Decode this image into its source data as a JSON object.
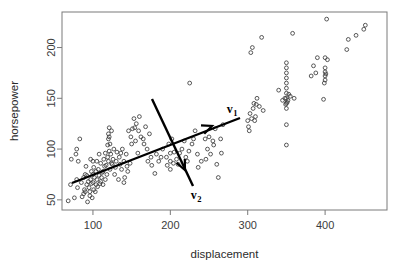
{
  "chart_data": {
    "type": "scatter",
    "title": "",
    "xlabel": "displacement",
    "ylabel": "horsepower",
    "xlim": [
      60,
      480
    ],
    "ylim": [
      40,
      235
    ],
    "xticks": [
      100,
      200,
      300,
      400
    ],
    "yticks": [
      50,
      100,
      150,
      200
    ],
    "grid": false,
    "legend": null,
    "marker": "open-circle",
    "marker_color": "#3b3b3b",
    "points": [
      [
        68,
        49
      ],
      [
        71,
        65
      ],
      [
        72,
        90
      ],
      [
        76,
        52
      ],
      [
        78,
        95
      ],
      [
        79,
        70
      ],
      [
        79,
        100
      ],
      [
        80,
        62
      ],
      [
        81,
        88
      ],
      [
        83,
        110
      ],
      [
        85,
        67
      ],
      [
        86,
        53
      ],
      [
        88,
        72
      ],
      [
        89,
        60
      ],
      [
        90,
        58
      ],
      [
        90,
        75
      ],
      [
        91,
        83
      ],
      [
        92,
        65
      ],
      [
        93,
        48
      ],
      [
        94,
        68
      ],
      [
        95,
        62
      ],
      [
        96,
        54
      ],
      [
        97,
        70
      ],
      [
        97,
        90
      ],
      [
        98,
        66
      ],
      [
        98,
        78
      ],
      [
        99,
        52
      ],
      [
        100,
        75
      ],
      [
        100,
        88
      ],
      [
        100,
        67
      ],
      [
        101,
        60
      ],
      [
        102,
        72
      ],
      [
        103,
        58
      ],
      [
        104,
        65
      ],
      [
        105,
        70
      ],
      [
        105,
        88
      ],
      [
        106,
        63
      ],
      [
        107,
        80
      ],
      [
        108,
        74
      ],
      [
        108,
        95
      ],
      [
        110,
        68
      ],
      [
        110,
        86
      ],
      [
        111,
        72
      ],
      [
        112,
        77
      ],
      [
        113,
        65
      ],
      [
        114,
        90
      ],
      [
        115,
        83
      ],
      [
        116,
        70
      ],
      [
        116,
        96
      ],
      [
        118,
        75
      ],
      [
        119,
        92
      ],
      [
        120,
        88
      ],
      [
        120,
        110
      ],
      [
        120,
        115
      ],
      [
        121,
        98
      ],
      [
        121,
        112
      ],
      [
        122,
        80
      ],
      [
        122,
        105
      ],
      [
        123,
        95
      ],
      [
        124,
        118
      ],
      [
        125,
        85
      ],
      [
        126,
        90
      ],
      [
        127,
        100
      ],
      [
        128,
        75
      ],
      [
        130,
        88
      ],
      [
        131,
        97
      ],
      [
        133,
        70
      ],
      [
        134,
        92
      ],
      [
        135,
        85
      ],
      [
        137,
        80
      ],
      [
        138,
        100
      ],
      [
        140,
        88
      ],
      [
        140,
        67
      ],
      [
        141,
        72
      ],
      [
        143,
        95
      ],
      [
        145,
        78
      ],
      [
        146,
        118
      ],
      [
        148,
        86
      ],
      [
        150,
        105
      ],
      [
        151,
        120
      ],
      [
        153,
        130
      ],
      [
        155,
        108
      ],
      [
        156,
        125
      ],
      [
        158,
        96
      ],
      [
        160,
        132
      ],
      [
        162,
        112
      ],
      [
        165,
        110
      ],
      [
        168,
        122
      ],
      [
        170,
        100
      ],
      [
        171,
        88
      ],
      [
        173,
        115
      ],
      [
        175,
        92
      ],
      [
        180,
        76
      ],
      [
        182,
        95
      ],
      [
        185,
        88
      ],
      [
        190,
        100
      ],
      [
        195,
        92
      ],
      [
        198,
        105
      ],
      [
        200,
        96
      ],
      [
        200,
        88
      ],
      [
        200,
        80
      ],
      [
        202,
        110
      ],
      [
        205,
        97
      ],
      [
        208,
        90
      ],
      [
        210,
        85
      ],
      [
        215,
        100
      ],
      [
        218,
        108
      ],
      [
        220,
        92
      ],
      [
        222,
        88
      ],
      [
        225,
        165
      ],
      [
        228,
        105
      ],
      [
        230,
        110
      ],
      [
        232,
        118
      ],
      [
        235,
        95
      ],
      [
        240,
        88
      ],
      [
        245,
        110
      ],
      [
        248,
        100
      ],
      [
        250,
        112
      ],
      [
        252,
        95
      ],
      [
        255,
        108
      ],
      [
        258,
        120
      ],
      [
        260,
        85
      ],
      [
        262,
        72
      ],
      [
        265,
        110
      ],
      [
        268,
        124
      ],
      [
        300,
        128
      ],
      [
        302,
        118
      ],
      [
        303,
        135
      ],
      [
        304,
        195
      ],
      [
        305,
        130
      ],
      [
        306,
        200
      ],
      [
        307,
        140
      ],
      [
        308,
        145
      ],
      [
        310,
        132
      ],
      [
        312,
        150
      ],
      [
        315,
        142
      ],
      [
        318,
        210
      ],
      [
        320,
        138
      ],
      [
        340,
        158
      ],
      [
        345,
        148
      ],
      [
        348,
        150
      ],
      [
        350,
        104
      ],
      [
        350,
        124
      ],
      [
        350,
        140
      ],
      [
        350,
        145
      ],
      [
        350,
        150
      ],
      [
        350,
        155
      ],
      [
        350,
        160
      ],
      [
        350,
        165
      ],
      [
        350,
        170
      ],
      [
        350,
        175
      ],
      [
        350,
        180
      ],
      [
        350,
        185
      ],
      [
        352,
        148
      ],
      [
        355,
        152
      ],
      [
        358,
        214
      ],
      [
        360,
        150
      ],
      [
        382,
        172
      ],
      [
        385,
        182
      ],
      [
        388,
        175
      ],
      [
        390,
        190
      ],
      [
        398,
        149
      ],
      [
        400,
        168
      ],
      [
        400,
        172
      ],
      [
        400,
        176
      ],
      [
        400,
        180
      ],
      [
        400,
        190
      ],
      [
        402,
        228
      ],
      [
        428,
        198
      ],
      [
        430,
        208
      ],
      [
        440,
        212
      ],
      [
        450,
        218
      ],
      [
        452,
        222
      ],
      [
        88,
        56
      ],
      [
        92,
        74
      ],
      [
        96,
        58
      ],
      [
        101,
        82
      ],
      [
        104,
        78
      ],
      [
        109,
        66
      ],
      [
        113,
        78
      ],
      [
        117,
        84
      ],
      [
        119,
        104
      ],
      [
        121,
        121
      ],
      [
        124,
        86
      ],
      [
        129,
        82
      ],
      [
        136,
        96
      ],
      [
        144,
        83
      ],
      [
        149,
        112
      ],
      [
        154,
        121
      ],
      [
        159,
        118
      ],
      [
        166,
        105
      ],
      [
        176,
        84
      ],
      [
        188,
        92
      ],
      [
        196,
        84
      ],
      [
        204,
        86
      ],
      [
        212,
        96
      ],
      [
        224,
        98
      ],
      [
        236,
        82
      ],
      [
        246,
        90
      ],
      [
        256,
        104
      ],
      [
        266,
        96
      ],
      [
        301,
        122
      ],
      [
        309,
        128
      ],
      [
        311,
        144
      ],
      [
        349,
        144
      ],
      [
        351,
        146
      ],
      [
        353,
        154
      ],
      [
        399,
        165
      ],
      [
        401,
        174
      ],
      [
        403,
        188
      ]
    ],
    "annotations": [
      {
        "name": "v1",
        "label": "v",
        "subscript": "1",
        "type": "arrow",
        "desc": "first principal component direction",
        "x1": 72,
        "y1": 183,
        "x2": 240,
        "y2": 118,
        "head_x": 212,
        "head_y": 126,
        "label_x": 232,
        "label_y": 113
      },
      {
        "name": "v2",
        "label": "v",
        "subscript": "2",
        "type": "arrow",
        "desc": "second principal component direction",
        "x1": 152,
        "y1": 99,
        "x2": 193,
        "y2": 186,
        "head_x": 185,
        "head_y": 170,
        "label_x": 196,
        "label_y": 199
      }
    ]
  },
  "axes": {
    "frame": {
      "left": 62,
      "top": 12,
      "right": 387,
      "bottom": 210
    },
    "x_title": "displacement",
    "y_title": "horsepower",
    "x_tick_labels": [
      "100",
      "200",
      "300",
      "400"
    ],
    "y_tick_labels": [
      "50",
      "100",
      "150",
      "200"
    ]
  },
  "colors": {
    "background": "#ffffff",
    "frame": "#7a7a7a",
    "point": "#3b3b3b",
    "arrow": "#000000",
    "text": "#2b2b2b"
  }
}
